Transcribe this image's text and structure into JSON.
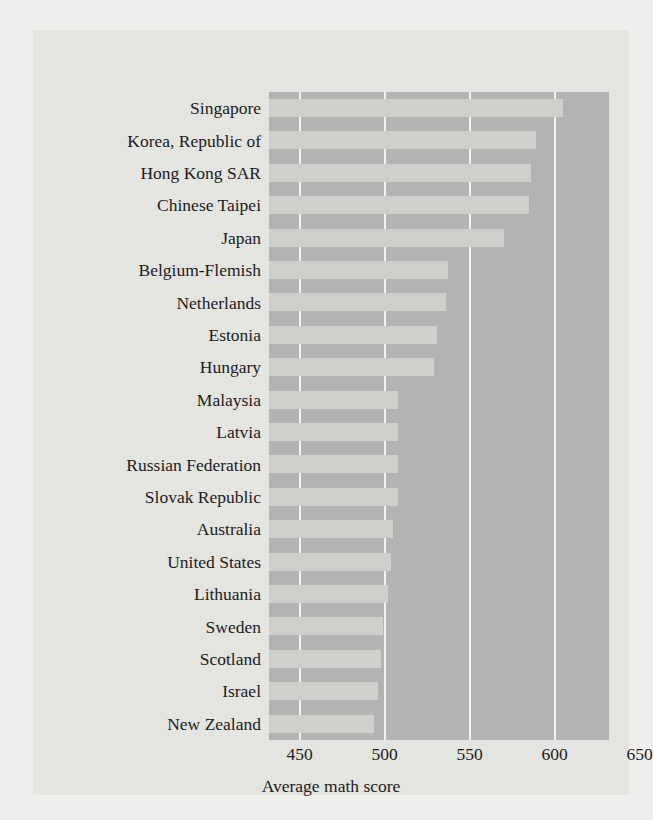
{
  "chart_data": {
    "type": "bar",
    "orientation": "horizontal",
    "title": "",
    "xlabel": "Average math score",
    "ylabel": "",
    "xlim": [
      432,
      632
    ],
    "xticks": [
      450,
      500,
      550,
      600,
      650
    ],
    "xticklabels": [
      "450",
      "500",
      "550",
      "600",
      "650"
    ],
    "grid": true,
    "grid_axis": "x",
    "legend": null,
    "categories": [
      "Singapore",
      "Korea, Republic of",
      "Hong Kong SAR",
      "Chinese Taipei",
      "Japan",
      "Belgium-Flemish",
      "Netherlands",
      "Estonia",
      "Hungary",
      "Malaysia",
      "Latvia",
      "Russian Federation",
      "Slovak Republic",
      "Australia",
      "United States",
      "Lithuania",
      "Sweden",
      "Scotland",
      "Israel",
      "New Zealand"
    ],
    "values": [
      605,
      589,
      586,
      585,
      570,
      537,
      536,
      531,
      529,
      508,
      508,
      508,
      508,
      505,
      504,
      502,
      499,
      498,
      496,
      494
    ],
    "colors": {
      "bar_fill": "#cfcfcc",
      "plot_background": "#b3b3b3",
      "gridline": "#f2f2f0",
      "figure_background": "#e4e4e1",
      "page_background": "#efefed",
      "text": "#1c1c1c"
    }
  }
}
